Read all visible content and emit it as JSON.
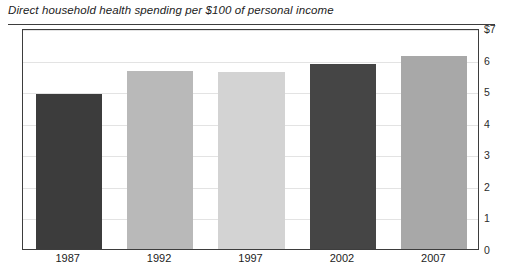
{
  "chart_data": {
    "type": "bar",
    "title": "Direct household health spending per $100 of personal income",
    "xlabel": "",
    "ylabel": "",
    "categories": [
      "1987",
      "1992",
      "1997",
      "2002",
      "2007"
    ],
    "values": [
      4.9,
      5.65,
      5.6,
      5.85,
      6.1
    ],
    "bar_colors": [
      "#3c3c3c",
      "#b9b9b9",
      "#d3d3d3",
      "#454545",
      "#a8a8a8"
    ],
    "ylim": [
      0,
      7
    ],
    "yticks": [
      0,
      1,
      2,
      3,
      4,
      5,
      6,
      7
    ],
    "ytick_labels": [
      "0",
      "1",
      "2",
      "3",
      "4",
      "5",
      "6",
      "$7"
    ],
    "grid": true,
    "legend": "none",
    "axis_color": "#3d3d3d",
    "grid_color": "#e3e3e3",
    "background_color": "#ffffff"
  }
}
